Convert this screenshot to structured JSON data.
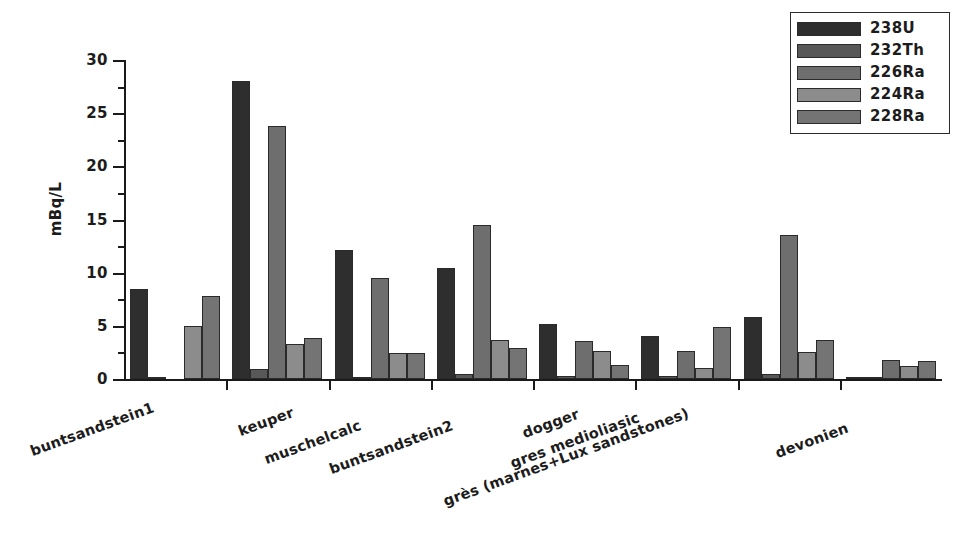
{
  "chart_data": {
    "type": "bar",
    "title": "",
    "subtitle": "",
    "xlabel": "",
    "ylabel": "mBq/L",
    "ylim": [
      0,
      30
    ],
    "y_major_ticks": [
      0,
      5,
      10,
      15,
      20,
      25,
      30
    ],
    "y_minor_ticks": [
      2.5,
      7.5,
      12.5,
      17.5,
      22.5,
      27.5
    ],
    "grid": false,
    "legend_position": "top-right",
    "categories": [
      "buntsandstein1",
      "keuper",
      "muschelcalc",
      "buntsandstein2",
      "dogger",
      "gres medioliasic",
      "grès (marnes+Lux sandstones)",
      "devonien"
    ],
    "series": [
      {
        "name": "238U",
        "color": "#2e2e2e",
        "values": [
          8.5,
          28.0,
          12.1,
          10.4,
          5.2,
          4.0,
          5.8,
          0.1
        ]
      },
      {
        "name": "232Th",
        "color": "#585858",
        "values": [
          0.15,
          0.9,
          0.2,
          0.5,
          0.3,
          0.3,
          0.45,
          0.1
        ]
      },
      {
        "name": "226Ra",
        "color": "#6e6e6e",
        "values": [
          0.0,
          23.8,
          9.5,
          14.5,
          3.6,
          2.6,
          13.5,
          1.8
        ]
      },
      {
        "name": "224Ra",
        "color": "#8c8c8c",
        "values": [
          5.0,
          3.3,
          2.4,
          3.7,
          2.6,
          1.0,
          2.5,
          1.2
        ]
      },
      {
        "name": "228Ra",
        "color": "#747474",
        "values": [
          7.8,
          3.9,
          2.4,
          2.9,
          1.3,
          4.9,
          3.7,
          1.7
        ]
      }
    ]
  },
  "legend": {
    "items": [
      {
        "label": "238U"
      },
      {
        "label": "232Th"
      },
      {
        "label": "226Ra"
      },
      {
        "label": "224Ra"
      },
      {
        "label": "228Ra"
      }
    ]
  },
  "axis": {
    "y_title": "mBq/L"
  }
}
